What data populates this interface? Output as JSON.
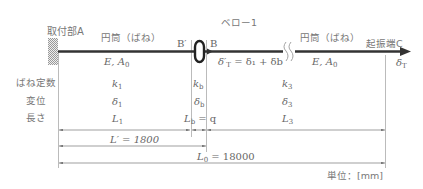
{
  "title": "ベロー1",
  "labels": {
    "mount": "取付部A",
    "tip": "起振端C",
    "cyl_left": "円筒（ばね）",
    "cyl_right": "円筒（ばね）",
    "prop_left": "E, A",
    "prop_left_sub": "0",
    "prop_right": "E, A",
    "prop_right_sub": "0",
    "b_prime": "B′",
    "b": "B",
    "delta_t_prime": "δ′",
    "delta_t_prime_sub": "T",
    "delta_t_prime_eq": "= δ₁ + δb",
    "delta_t": "δ",
    "delta_t_sub": "T"
  },
  "rows": {
    "spring_const": "ばね定数",
    "displacement": "変位",
    "length": "長さ"
  },
  "table": {
    "col1": {
      "k": "k",
      "k_sub": "1",
      "d": "δ",
      "d_sub": "1",
      "l": "L",
      "l_sub": "1"
    },
    "colb": {
      "k": "k",
      "k_sub": "b",
      "d": "δ",
      "d_sub": "b",
      "l": "L",
      "l_sub": "b",
      "l_eq": "= q"
    },
    "col3": {
      "k": "k",
      "k_sub": "3",
      "d": "δ",
      "d_sub": "3",
      "l": "L",
      "l_sub": "3"
    }
  },
  "dimensions": {
    "l_prime": "L′ = 1800",
    "l0_main": "L",
    "l0_sub": "0",
    "l0_val": "= 18000"
  },
  "unit": "単位：[mm]",
  "colors": {
    "line": "#333333",
    "thin": "#999999",
    "text": "#666666"
  }
}
